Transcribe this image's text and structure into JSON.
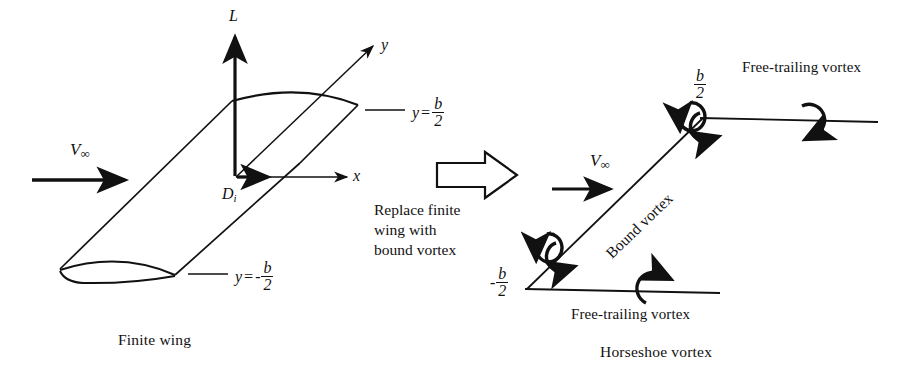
{
  "figure": {
    "title_left": "Finite wing",
    "title_right": "Horseshoe vortex",
    "background_color": "#ffffff",
    "ink_color": "#111111"
  },
  "left_diagram": {
    "caption": "Finite wing",
    "freestream_symbol": "V",
    "freestream_subscript": "∞",
    "axes": {
      "lift_label": "L",
      "spanwise_label": "y",
      "chordwise_label": "x",
      "induced_drag_symbol": "D",
      "induced_drag_subscript": "i"
    },
    "tip_label_upper": {
      "variable": "y",
      "equals": "=",
      "numerator": "b",
      "denominator": "2",
      "sign": ""
    },
    "tip_label_lower": {
      "variable": "y",
      "equals": "=",
      "numerator": "b",
      "denominator": "2",
      "sign": "-"
    }
  },
  "transition": {
    "arrow_icon": "block-arrow-right",
    "text_lines": [
      "Replace finite",
      "wing with",
      "bound vortex"
    ]
  },
  "right_diagram": {
    "caption": "Horseshoe vortex",
    "freestream_symbol": "V",
    "freestream_subscript": "∞",
    "bound_vortex_label": "Bound vortex",
    "free_trailing_label_top": "Free-trailing vortex",
    "free_trailing_label_bottom": "Free-trailing vortex",
    "tip_label_upper": {
      "numerator": "b",
      "denominator": "2",
      "sign": ""
    },
    "tip_label_lower": {
      "numerator": "b",
      "denominator": "2",
      "sign": "-"
    }
  }
}
